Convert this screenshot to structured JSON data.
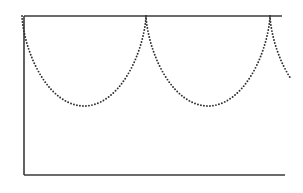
{
  "figure": {
    "kind": "line-diagram",
    "background_color": "#ffffff",
    "caption": "",
    "title": ""
  },
  "axes": {
    "stroke_color": "#3a3a3a",
    "stroke_width": 1.6,
    "top_rule": {
      "x1": 24,
      "y1": 16,
      "x2": 282,
      "y2": 16
    },
    "left_rule": {
      "x1": 24,
      "y1": 16,
      "x2": 24,
      "y2": 175
    },
    "bottom_rule": {
      "x1": 24,
      "y1": 175,
      "x2": 285,
      "y2": 175
    },
    "right_rule_present": false
  },
  "chart_data": {
    "type": "line",
    "title": "",
    "xlabel": "",
    "ylabel": "",
    "subtitle": "",
    "grid": false,
    "legend": null,
    "curve_name": "inverted-cycloid",
    "line_style": "dotted",
    "line_color": "#2e2e2e",
    "dot_radius": 0.95,
    "dot_spacing": 3.0,
    "xlim": [
      24,
      303
    ],
    "ylim": [
      175,
      16
    ],
    "cusp_y": 16,
    "valley_y": 106,
    "arch_depth": 90,
    "arch_period": 124,
    "cusps_x": [
      22,
      146,
      270
    ],
    "valleys": [
      {
        "x": 84,
        "y": 106
      },
      {
        "x": 208,
        "y": 106
      }
    ],
    "clip_right_x": 291,
    "final_partial_arch_end": {
      "x": 291,
      "y": 73
    },
    "sampled_points": [
      {
        "x": 22,
        "y": 16
      },
      {
        "x": 24,
        "y": 27
      },
      {
        "x": 27,
        "y": 36
      },
      {
        "x": 31,
        "y": 45
      },
      {
        "x": 36,
        "y": 54
      },
      {
        "x": 42,
        "y": 62
      },
      {
        "x": 49,
        "y": 71
      },
      {
        "x": 57,
        "y": 80
      },
      {
        "x": 66,
        "y": 90
      },
      {
        "x": 75,
        "y": 99
      },
      {
        "x": 84,
        "y": 106
      },
      {
        "x": 94,
        "y": 102
      },
      {
        "x": 104,
        "y": 96
      },
      {
        "x": 113,
        "y": 87
      },
      {
        "x": 121,
        "y": 76
      },
      {
        "x": 129,
        "y": 63
      },
      {
        "x": 136,
        "y": 49
      },
      {
        "x": 141,
        "y": 35
      },
      {
        "x": 145,
        "y": 22
      },
      {
        "x": 146,
        "y": 16
      },
      {
        "x": 148,
        "y": 27
      },
      {
        "x": 151,
        "y": 36
      },
      {
        "x": 155,
        "y": 45
      },
      {
        "x": 160,
        "y": 54
      },
      {
        "x": 166,
        "y": 62
      },
      {
        "x": 173,
        "y": 71
      },
      {
        "x": 181,
        "y": 80
      },
      {
        "x": 190,
        "y": 90
      },
      {
        "x": 199,
        "y": 99
      },
      {
        "x": 208,
        "y": 106
      },
      {
        "x": 218,
        "y": 102
      },
      {
        "x": 228,
        "y": 96
      },
      {
        "x": 237,
        "y": 87
      },
      {
        "x": 245,
        "y": 76
      },
      {
        "x": 253,
        "y": 63
      },
      {
        "x": 260,
        "y": 49
      },
      {
        "x": 265,
        "y": 35
      },
      {
        "x": 269,
        "y": 22
      },
      {
        "x": 270,
        "y": 16
      },
      {
        "x": 272,
        "y": 27
      },
      {
        "x": 275,
        "y": 36
      },
      {
        "x": 279,
        "y": 45
      },
      {
        "x": 284,
        "y": 54
      },
      {
        "x": 288,
        "y": 64
      },
      {
        "x": 291,
        "y": 73
      }
    ]
  }
}
